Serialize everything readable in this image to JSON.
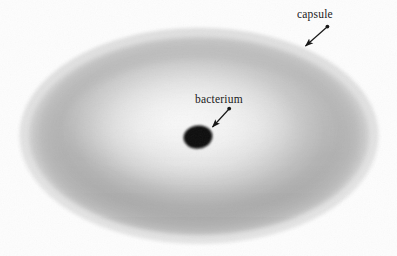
{
  "figure": {
    "type": "biology-diagram",
    "background_color": "#fdfdfd",
    "labels": {
      "capsule": "capsule",
      "bacterium": "bacterium"
    },
    "capsule": {
      "name": "capsule",
      "shape": "ellipse",
      "center_x": 199,
      "center_y": 136,
      "radius_x": 179,
      "radius_y": 107,
      "fill_light": "#f2f2f2",
      "fill_mid": "#c9c9c9",
      "fill_dark": "#a8a8a8",
      "edge_color": "#d8d8d8"
    },
    "bacterium": {
      "name": "bacterium",
      "shape": "ellipse",
      "center_x": 198,
      "center_y": 137,
      "radius_x": 14,
      "radius_y": 11,
      "fill": "#0d0d0d",
      "rotation_deg": -8
    },
    "annotations": [
      {
        "name": "capsule-leader",
        "label": "capsule",
        "tail_x": 327,
        "tail_y": 27,
        "head_x": 303,
        "head_y": 48,
        "color": "#141414"
      },
      {
        "name": "bacterium-leader",
        "label": "bacterium",
        "tail_x": 229,
        "tail_y": 109,
        "head_x": 210,
        "head_y": 129,
        "color": "#141414"
      }
    ]
  }
}
